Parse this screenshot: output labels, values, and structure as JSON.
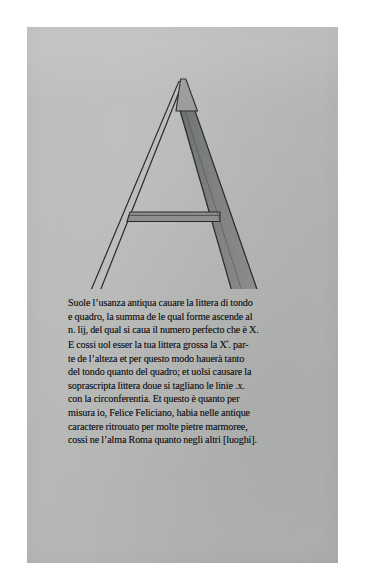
{
  "page": {
    "kind": "scanned-book-leaf",
    "paper_color": "#b9bbb9",
    "ink_color": "#18181a",
    "surround_color": "#ffffff"
  },
  "plate": {
    "letter": "A",
    "caption": "constructed-roman-capital-A",
    "stroke_outline_color": "#2b2b2d",
    "shade_fill_color": "#7e8180",
    "thin_fill_color": "#b9bbb9",
    "parts": [
      "left-thin-stroke",
      "right-thick-shaded-stroke",
      "crossbar",
      "left-foot-serif",
      "right-foot-serif",
      "apex"
    ]
  },
  "body_text": {
    "lines": [
      "Suole l’usanza antiqua cauare la littera di tondo",
      "e quadro, la summa de le qual forme ascende al",
      "n. lij, del qual si caua il numero perfecto che è X.",
      "E cossi uol esser la tua littera grossa la Xª. par-",
      "te de l’alteza et per questo modo hauerà tanto",
      "del tondo quanto del quadro; et uolsi causare la",
      "soprascripta littera doue si tagliano le linie .x.",
      "con la circonferentia. Et questo è quanto per",
      "misura io, Felice Feliciano, habia nelle antique",
      "caractere ritrouato per molte pietre marmoree,",
      "cossì ne l’alma Roma quanto negli altri [luoghi]."
    ],
    "line_with_superscript_index": 3,
    "superscript_glyph": "ª"
  }
}
